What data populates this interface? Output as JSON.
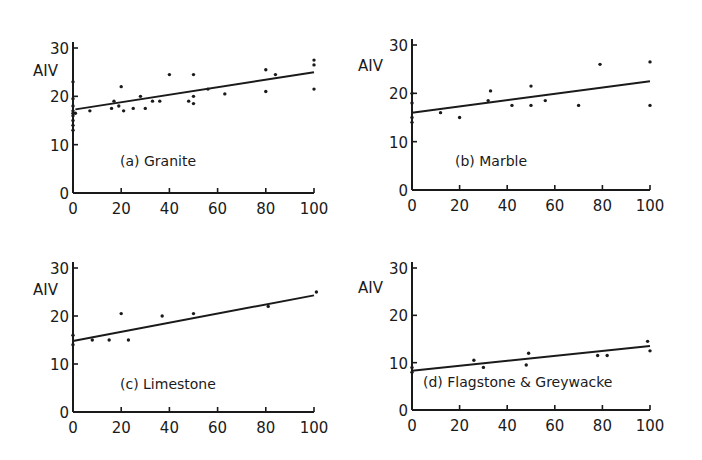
{
  "chart_data": [
    {
      "type": "scatter",
      "title": "(a) Granite",
      "xlabel": "",
      "ylabel": "AIV",
      "xlim": [
        0,
        100
      ],
      "ylim": [
        0,
        30
      ],
      "xticks": [
        0,
        20,
        40,
        60,
        80,
        100
      ],
      "yticks": [
        0,
        10,
        20,
        30
      ],
      "grid": false,
      "points": [
        [
          0,
          23
        ],
        [
          0,
          19.5
        ],
        [
          0,
          18
        ],
        [
          0,
          17
        ],
        [
          0,
          16.5
        ],
        [
          0,
          16
        ],
        [
          0,
          15
        ],
        [
          0,
          14
        ],
        [
          0,
          13
        ],
        [
          1,
          16.5
        ],
        [
          7,
          17
        ],
        [
          16,
          17.5
        ],
        [
          17,
          19
        ],
        [
          19,
          18
        ],
        [
          20,
          22
        ],
        [
          21,
          17
        ],
        [
          25,
          17.5
        ],
        [
          28,
          20
        ],
        [
          30,
          17.5
        ],
        [
          33,
          19
        ],
        [
          36,
          19
        ],
        [
          40,
          24.5
        ],
        [
          48,
          19
        ],
        [
          50,
          24.5
        ],
        [
          50,
          20
        ],
        [
          50,
          18.5
        ],
        [
          56,
          21.5
        ],
        [
          63,
          20.5
        ],
        [
          80,
          25.5
        ],
        [
          80,
          21
        ],
        [
          84,
          24.5
        ],
        [
          100,
          27.5
        ],
        [
          100,
          26.5
        ],
        [
          100,
          21.5
        ]
      ],
      "fit_line": {
        "x": [
          1,
          100
        ],
        "y": [
          17.3,
          25
        ]
      }
    },
    {
      "type": "scatter",
      "title": "(b) Marble",
      "xlabel": "",
      "ylabel": "AIV",
      "xlim": [
        0,
        100
      ],
      "ylim": [
        0,
        30
      ],
      "xticks": [
        0,
        20,
        40,
        60,
        80,
        100
      ],
      "yticks": [
        0,
        10,
        20,
        30
      ],
      "grid": false,
      "points": [
        [
          0,
          20
        ],
        [
          0,
          18
        ],
        [
          0,
          15
        ],
        [
          0,
          14
        ],
        [
          12,
          16
        ],
        [
          20,
          15
        ],
        [
          32,
          18.5
        ],
        [
          33,
          20.5
        ],
        [
          42,
          17.5
        ],
        [
          50,
          21.5
        ],
        [
          50,
          17.5
        ],
        [
          56,
          18.5
        ],
        [
          70,
          17.5
        ],
        [
          79,
          26
        ],
        [
          100,
          26.5
        ],
        [
          100,
          17.5
        ]
      ],
      "fit_line": {
        "x": [
          0,
          100
        ],
        "y": [
          16,
          22.5
        ]
      }
    },
    {
      "type": "scatter",
      "title": "(c) Limestone",
      "xlabel": "",
      "ylabel": "AIV",
      "xlim": [
        0,
        100
      ],
      "ylim": [
        0,
        30
      ],
      "xticks": [
        0,
        20,
        40,
        60,
        80,
        100
      ],
      "yticks": [
        0,
        10,
        20,
        30
      ],
      "grid": false,
      "points": [
        [
          0,
          16
        ],
        [
          0,
          14
        ],
        [
          8,
          15
        ],
        [
          15,
          15
        ],
        [
          20,
          20.5
        ],
        [
          23,
          15
        ],
        [
          37,
          20
        ],
        [
          50,
          20.5
        ],
        [
          81,
          22
        ],
        [
          101,
          25
        ]
      ],
      "fit_line": {
        "x": [
          0,
          100
        ],
        "y": [
          14.8,
          24.3
        ]
      }
    },
    {
      "type": "scatter",
      "title": "(d) Flagstone & Greywacke",
      "xlabel": "",
      "ylabel": "AIV",
      "xlim": [
        0,
        100
      ],
      "ylim": [
        0,
        30
      ],
      "xticks": [
        0,
        20,
        40,
        60,
        80,
        100
      ],
      "yticks": [
        0,
        10,
        20,
        30
      ],
      "grid": false,
      "points": [
        [
          0,
          9
        ],
        [
          0,
          8
        ],
        [
          26,
          10.5
        ],
        [
          30,
          9
        ],
        [
          48,
          9.5
        ],
        [
          49,
          12
        ],
        [
          78,
          11.5
        ],
        [
          82,
          11.5
        ],
        [
          99,
          14.5
        ],
        [
          100,
          12.5
        ]
      ],
      "fit_line": {
        "x": [
          0,
          100
        ],
        "y": [
          8.3,
          13.5
        ]
      }
    }
  ],
  "panels": [
    {
      "label": "(a)  Granite",
      "ylabel": "AIV"
    },
    {
      "label": "(b)  Marble",
      "ylabel": "AIV"
    },
    {
      "label": "(c)  Limestone",
      "ylabel": "AIV"
    },
    {
      "label": "(d) Flagstone  &  Greywacke",
      "ylabel": "AIV"
    }
  ],
  "colors": {
    "ink": "#1a1a1a",
    "background": "#ffffff"
  }
}
